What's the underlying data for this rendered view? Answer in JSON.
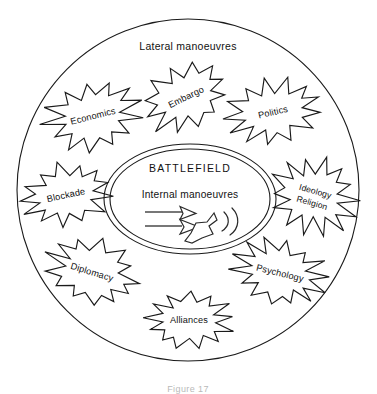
{
  "figure": {
    "title_label": "Lateral manoeuvres",
    "caption_label": "Figure 17",
    "colors": {
      "ink": "#1a1a1a",
      "background": "#ffffff",
      "arrow_line": "#4a4a4a",
      "caption": "#b9b9b9"
    }
  },
  "core": {
    "heading": "BATTLEFIELD",
    "subheading": "Internal manoeuvres",
    "arrows": [
      {
        "name": "inward-arrow-upper",
        "direction": "right"
      },
      {
        "name": "inward-arrow-lower",
        "direction": "right"
      },
      {
        "name": "counter-arrow-curved",
        "direction": "down-left"
      }
    ]
  },
  "bursts": [
    {
      "id": "economics",
      "label": "Economics",
      "label2": "",
      "cx": 93,
      "cy": 116,
      "rx": 48,
      "ry": 33,
      "rotate": -14,
      "points": 13,
      "seed": 3
    },
    {
      "id": "embargo",
      "label": "Embargo",
      "label2": "",
      "cx": 186,
      "cy": 97,
      "rx": 43,
      "ry": 31,
      "rotate": -26,
      "points": 12,
      "seed": 7
    },
    {
      "id": "politics",
      "label": "Politics",
      "label2": "",
      "cx": 273,
      "cy": 112,
      "rx": 46,
      "ry": 31,
      "rotate": -13,
      "points": 13,
      "seed": 11
    },
    {
      "id": "blockade",
      "label": "Blockade",
      "label2": "",
      "cx": 66,
      "cy": 195,
      "rx": 45,
      "ry": 30,
      "rotate": -12,
      "points": 13,
      "seed": 17
    },
    {
      "id": "ideology",
      "label": "Ideology",
      "label2": "Religion",
      "cx": 314,
      "cy": 196,
      "rx": 42,
      "ry": 36,
      "rotate": 16,
      "points": 14,
      "seed": 23
    },
    {
      "id": "diplomacy",
      "label": "Diplomacy",
      "label2": "",
      "cx": 92,
      "cy": 272,
      "rx": 47,
      "ry": 31,
      "rotate": 17,
      "points": 13,
      "seed": 29
    },
    {
      "id": "psychology",
      "label": "Psychology",
      "label2": "",
      "cx": 280,
      "cy": 273,
      "rx": 46,
      "ry": 31,
      "rotate": 14,
      "points": 14,
      "seed": 31
    },
    {
      "id": "alliances",
      "label": "Alliances",
      "label2": "",
      "cx": 189,
      "cy": 320,
      "rx": 43,
      "ry": 27,
      "rotate": 0,
      "points": 13,
      "seed": 37
    }
  ],
  "geometry": {
    "outer_circle": {
      "cx": 188,
      "cy": 190,
      "r": 171
    },
    "core_ellipse_outer": {
      "cx": 190,
      "cy": 199,
      "rx": 86,
      "ry": 55
    },
    "core_ellipse_inner": {
      "cx": 190,
      "cy": 199,
      "rx": 80,
      "ry": 50
    }
  }
}
